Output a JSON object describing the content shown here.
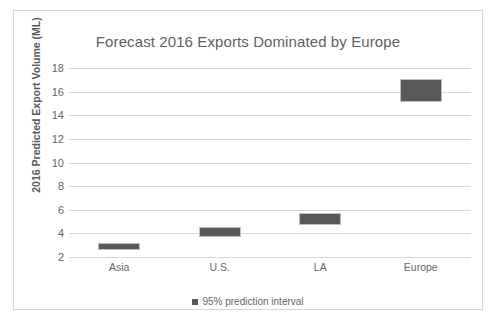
{
  "chart_data": {
    "type": "bar",
    "title": "Forecast 2016 Exports Dominated by Europe",
    "xlabel": "",
    "ylabel": "2016 Predicted Export Volume (ML)",
    "categories": [
      "Asia",
      "U.S.",
      "LA",
      "Europe"
    ],
    "ylim": [
      2,
      18
    ],
    "yticks": [
      2,
      4,
      6,
      8,
      10,
      12,
      14,
      16,
      18
    ],
    "ytick_labels": [
      "2",
      "4",
      "6",
      "8",
      "10",
      "12",
      "14",
      "16",
      "18"
    ],
    "grid": true,
    "legend_position": "bottom",
    "series": [
      {
        "name": "95% prediction interval",
        "kind": "interval",
        "color": "#595959",
        "intervals": [
          {
            "category": "Asia",
            "low": 2.6,
            "high": 3.2,
            "center": 2.9
          },
          {
            "category": "U.S.",
            "low": 3.7,
            "high": 4.5,
            "center": 4.1
          },
          {
            "category": "LA",
            "low": 4.75,
            "high": 5.75,
            "center": 5.25
          },
          {
            "category": "Europe",
            "low": 15.1,
            "high": 17.1,
            "center": 16.1
          }
        ]
      }
    ],
    "legend": [
      "95% prediction interval"
    ]
  },
  "colors": {
    "bar": "#595959",
    "gridline": "#d9d9d9",
    "border": "#d4d4d4",
    "text": "#666666"
  }
}
